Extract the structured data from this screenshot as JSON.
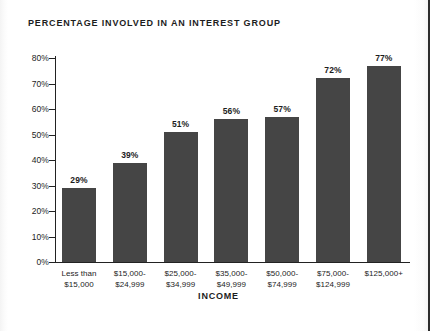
{
  "chart_data": {
    "type": "bar",
    "title": "PERCENTAGE INVOLVED IN AN INTEREST GROUP",
    "xlabel": "INCOME",
    "ylabel": "",
    "categories": [
      "Less than\n$15,000",
      "$15,000-\n$24,999",
      "$25,000-\n$34,999",
      "$35,000-\n$49,999",
      "$50,000-\n$74,999",
      "$75,000-\n$124,999",
      "$125,000+"
    ],
    "category_lines": [
      [
        "Less than",
        "$15,000"
      ],
      [
        "$15,000-",
        "$24,999"
      ],
      [
        "$25,000-",
        "$34,999"
      ],
      [
        "$35,000-",
        "$49,999"
      ],
      [
        "$50,000-",
        "$74,999"
      ],
      [
        "$75,000-",
        "$124,999"
      ],
      [
        "$125,000+",
        ""
      ]
    ],
    "values": [
      29,
      39,
      51,
      56,
      57,
      72,
      77
    ],
    "value_labels": [
      "29%",
      "39%",
      "51%",
      "56%",
      "57%",
      "72%",
      "77%"
    ],
    "ylim": [
      0,
      80
    ],
    "ytick_values": [
      0,
      10,
      20,
      30,
      40,
      50,
      60,
      70,
      80
    ],
    "ytick_labels": [
      "0%",
      "10%",
      "20%",
      "30%",
      "40%",
      "50%",
      "60%",
      "70%",
      "80%"
    ],
    "grid": false,
    "legend": null,
    "bar_color": "#454545",
    "axis_color": "#222222",
    "text_color": "#1d1d1d",
    "background": "#ffffff"
  }
}
